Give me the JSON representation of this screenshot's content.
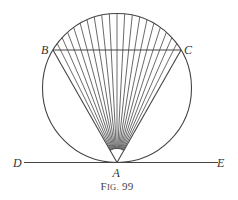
{
  "figure": {
    "caption_prefix": "F",
    "caption_smallcaps": "IG.",
    "caption_number": " 99",
    "caption": "Fig. 99",
    "labels": {
      "A": "A",
      "B": "B",
      "C": "C",
      "D": "D",
      "E": "E"
    },
    "circle": {
      "cx": 117,
      "cy": 88,
      "r": 74.5
    },
    "points": {
      "A": [
        117,
        162.5
      ],
      "B": [
        53,
        50
      ],
      "C": [
        181,
        50
      ]
    },
    "tangent_line": {
      "x1": 24,
      "x2": 218,
      "y": 162.5
    },
    "fan_line_count": 19,
    "angle_marker_radius": 14,
    "stroke_color": "#444444"
  }
}
